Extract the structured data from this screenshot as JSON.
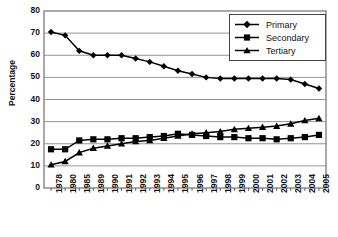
{
  "chart_data": {
    "type": "line",
    "title": "",
    "xlabel": "",
    "ylabel": "Percentage",
    "ylim": [
      0,
      80
    ],
    "ytick_step": 10,
    "yticks": [
      0,
      10,
      20,
      30,
      40,
      50,
      60,
      70,
      80
    ],
    "grid": true,
    "legend_position": "top-right",
    "categories": [
      "1978",
      "1980",
      "1985",
      "1989",
      "1990",
      "1991",
      "1992",
      "1993",
      "1994",
      "1995",
      "1996",
      "1997",
      "1998",
      "1999",
      "2000",
      "2001",
      "2002",
      "2003",
      "2004",
      "2005"
    ],
    "series": [
      {
        "name": "Primary",
        "marker": "diamond",
        "color": "#000000",
        "values": [
          70.5,
          69.0,
          62.0,
          60.0,
          60.0,
          60.0,
          58.5,
          57.0,
          55.0,
          53.0,
          51.5,
          50.0,
          49.5,
          49.5,
          49.5,
          49.5,
          49.5,
          49.0,
          47.0,
          45.0
        ]
      },
      {
        "name": "Secondary",
        "marker": "square",
        "color": "#000000",
        "values": [
          17.5,
          17.5,
          21.5,
          22.0,
          22.0,
          22.5,
          22.5,
          23.0,
          23.5,
          24.5,
          24.0,
          23.5,
          23.0,
          23.0,
          22.5,
          22.5,
          22.0,
          22.5,
          23.0,
          24.0
        ]
      },
      {
        "name": "Tertiary",
        "marker": "triangle",
        "color": "#000000",
        "values": [
          10.5,
          12.0,
          16.0,
          18.0,
          19.0,
          20.0,
          21.0,
          21.5,
          22.5,
          23.5,
          24.5,
          25.0,
          25.5,
          26.5,
          27.0,
          27.5,
          28.0,
          29.0,
          30.5,
          31.5
        ]
      }
    ]
  },
  "legend": {
    "items": [
      {
        "label": "Primary",
        "marker": "diamond"
      },
      {
        "label": "Secondary",
        "marker": "square"
      },
      {
        "label": "Tertiary",
        "marker": "triangle"
      }
    ]
  },
  "axes": {
    "y_title": "Percentage"
  }
}
